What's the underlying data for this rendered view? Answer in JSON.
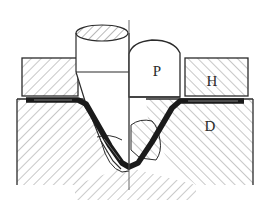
{
  "figure": {
    "background_color": "#ffffff",
    "outline_color": "#2b2b2b",
    "hatch_color": "#9a9a9a",
    "blank_color": "#1a1a1a",
    "width": 257,
    "height": 211
  },
  "labels": {
    "punch": "P",
    "holder": "H",
    "die": "D"
  },
  "parts": [
    {
      "key": "punch",
      "label": "P",
      "name": "punch"
    },
    {
      "key": "holder",
      "label": "H",
      "name": "blank-holder"
    },
    {
      "key": "die",
      "label": "D",
      "name": "die"
    }
  ],
  "label_positions": {
    "punch": {
      "x": 157,
      "y": 76
    },
    "holder": {
      "x": 212,
      "y": 86
    },
    "die": {
      "x": 210,
      "y": 131
    }
  },
  "geometry": {
    "centerline": {
      "x": 129,
      "y1": 20,
      "y2": 190
    },
    "punch_cylinder": {
      "left": 76,
      "right": 129,
      "top": 31,
      "bottom": 72
    },
    "punch_ellipse": {
      "cx": 102,
      "cy": 33,
      "rx": 26,
      "ry": 8
    },
    "punch_dome": {
      "left": 129,
      "right": 182,
      "top": 40,
      "bottom": 97
    },
    "holder_left": {
      "left": 22,
      "top": 58,
      "right": 78,
      "bottom": 96
    },
    "holder_right": {
      "left": 185,
      "top": 58,
      "right": 248,
      "bottom": 96
    },
    "die_left": {
      "left": 17,
      "top": 99,
      "right": 129,
      "bottom": 185
    },
    "die_right": {
      "left": 129,
      "top": 99,
      "right": 253,
      "bottom": 185
    }
  }
}
